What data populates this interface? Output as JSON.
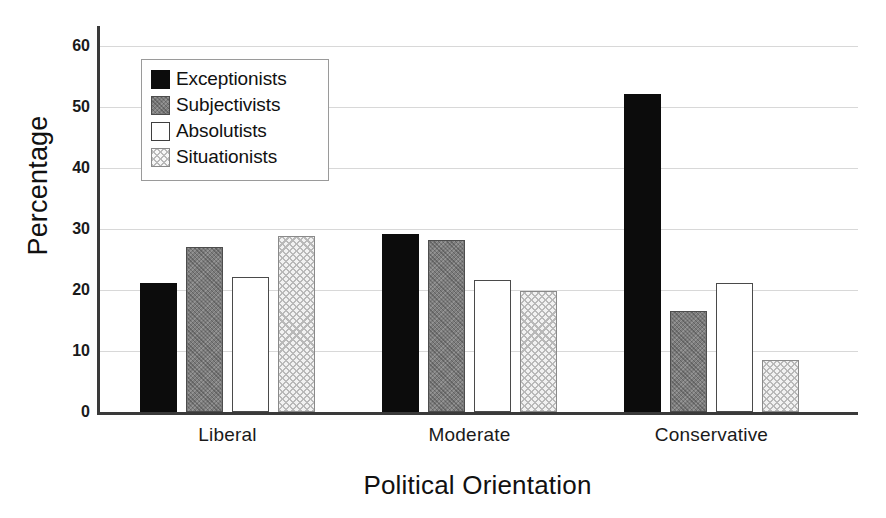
{
  "chart_data": {
    "type": "bar",
    "title": "",
    "xlabel": "Political Orientation",
    "ylabel": "Percentage",
    "categories": [
      "Liberal",
      "Moderate",
      "Conservative"
    ],
    "series": [
      {
        "name": "Exceptionists",
        "values": [
          21.2,
          29.2,
          52.2
        ],
        "fill": "solid-black",
        "color": "#0c0c0c"
      },
      {
        "name": "Subjectivists",
        "values": [
          27.0,
          28.2,
          16.5
        ],
        "fill": "dark-gray-texture",
        "color": "#7d7d7d"
      },
      {
        "name": "Absolutists",
        "values": [
          22.2,
          21.7,
          21.1
        ],
        "fill": "white-outline",
        "color": "#ffffff"
      },
      {
        "name": "Situationists",
        "values": [
          28.8,
          19.8,
          8.6
        ],
        "fill": "light-dotted",
        "color": "#f2f2f2"
      }
    ],
    "ylim": [
      0,
      62
    ],
    "yticks": [
      0,
      10,
      20,
      30,
      40,
      50,
      60
    ],
    "ytick_labels": [
      "0",
      "10",
      "20",
      "30",
      "40",
      "50",
      "60"
    ],
    "grid": "horizontal",
    "legend_position": "upper-left-inside"
  },
  "axes": {
    "y_title": "Percentage",
    "x_title": "Political Orientation"
  },
  "legend": {
    "entries": [
      {
        "label": "Exceptionists"
      },
      {
        "label": "Subjectivists"
      },
      {
        "label": "Absolutists"
      },
      {
        "label": "Situationists"
      }
    ]
  }
}
